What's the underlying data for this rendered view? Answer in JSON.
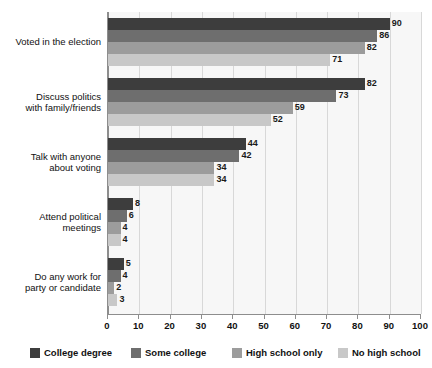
{
  "chart_data": {
    "type": "bar",
    "orientation": "horizontal",
    "grouped": true,
    "title": "",
    "subtitle": "",
    "xlabel": "",
    "ylabel": "",
    "xlim": [
      0,
      100
    ],
    "xticks": [
      0,
      10,
      20,
      30,
      40,
      50,
      60,
      70,
      80,
      90,
      100
    ],
    "tick_labels": [
      "0",
      "10",
      "20",
      "30",
      "40",
      "50",
      "60",
      "70",
      "80",
      "90",
      "100"
    ],
    "grid": "vertical",
    "legend_position": "bottom",
    "categories": [
      "Voted in the election",
      "Discuss politics\nwith family/friends",
      "Talk with anyone\nabout voting",
      "Attend political\nmeetings",
      "Do any work for\nparty or candidate"
    ],
    "series": [
      {
        "name": "College degree",
        "color": "#3d3d3d",
        "values": [
          90,
          82,
          44,
          8,
          5
        ],
        "labels": [
          "90",
          "82",
          "44",
          "8",
          "5"
        ]
      },
      {
        "name": "Some college",
        "color": "#6e6e6e",
        "values": [
          86,
          73,
          42,
          6,
          4
        ],
        "labels": [
          "86",
          "73",
          "42",
          "6",
          "4"
        ]
      },
      {
        "name": "High school only",
        "color": "#9c9c9c",
        "values": [
          82,
          59,
          34,
          4,
          2
        ],
        "labels": [
          "82",
          "59",
          "34",
          "4",
          "2"
        ]
      },
      {
        "name": "No high school",
        "color": "#c8c8c8",
        "values": [
          71,
          52,
          34,
          4,
          3
        ],
        "labels": [
          "71",
          "52",
          "34",
          "4",
          "3"
        ]
      }
    ],
    "colors": {
      "plot_background": "#f7f7f7",
      "gridline": "#d8d8d8",
      "axis": "#8d8d8d",
      "text": "#111111"
    }
  }
}
